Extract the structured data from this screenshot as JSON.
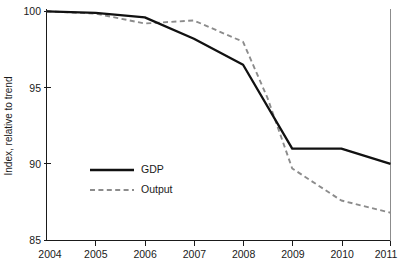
{
  "chart_data": {
    "type": "line",
    "title": "",
    "xlabel": "",
    "ylabel": "Index, relative to trend",
    "xlim": [
      2004,
      2011
    ],
    "ylim": [
      85,
      100
    ],
    "grid": false,
    "legend_position": "inside-left-lower",
    "x_ticks": [
      "2004",
      "2005",
      "2006",
      "2007",
      "2008",
      "2009",
      "2010",
      "2011"
    ],
    "y_ticks": [
      "85",
      "90",
      "95",
      "100"
    ],
    "series": [
      {
        "name": "GDP",
        "style": "solid",
        "color": "#111111",
        "x": [
          2004,
          2005,
          2006,
          2007,
          2008,
          2009,
          2010,
          2011
        ],
        "values": [
          100.0,
          99.9,
          99.6,
          98.2,
          96.5,
          91.0,
          91.0,
          90.0
        ]
      },
      {
        "name": "Output",
        "style": "dashed",
        "color": "#8c8c8c",
        "x": [
          2004,
          2005,
          2006,
          2007,
          2008,
          2008.5,
          2009,
          2010,
          2011
        ],
        "values": [
          100.0,
          99.85,
          99.2,
          99.4,
          98.0,
          94.3,
          89.7,
          87.6,
          86.8
        ]
      }
    ]
  },
  "legend": {
    "items": [
      {
        "label": "GDP"
      },
      {
        "label": "Output"
      }
    ]
  }
}
